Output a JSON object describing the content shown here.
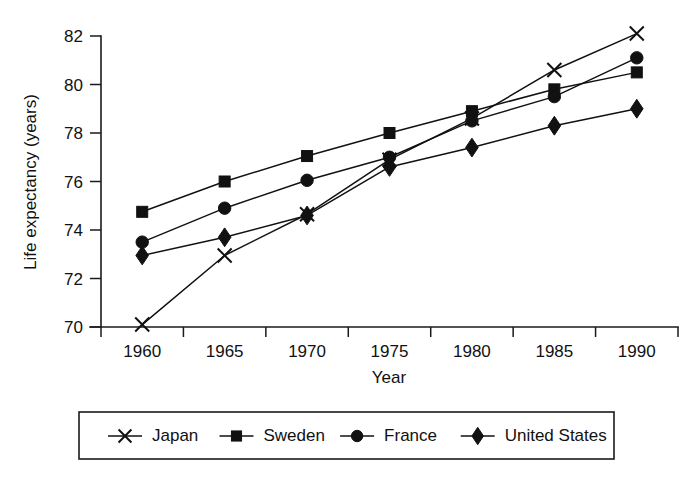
{
  "chart_data": {
    "type": "line",
    "title": "",
    "xlabel": "Year",
    "ylabel": "Life expectancy (years)",
    "categories": [
      "1960",
      "1965",
      "1970",
      "1975",
      "1980",
      "1985",
      "1990"
    ],
    "x": [
      1960,
      1965,
      1970,
      1975,
      1980,
      1985,
      1990
    ],
    "ylim": [
      70,
      82
    ],
    "yticks": [
      "70",
      "72",
      "74",
      "76",
      "78",
      "80",
      "82"
    ],
    "ytick_values": [
      70,
      72,
      74,
      76,
      78,
      80,
      82
    ],
    "xticks": [
      "1960",
      "1965",
      "1970",
      "1975",
      "1980",
      "1985",
      "1990"
    ],
    "grid": false,
    "legend_position": "bottom",
    "series": [
      {
        "name": "Japan",
        "marker": "cross-x",
        "values": [
          70.1,
          72.95,
          74.65,
          76.9,
          78.6,
          80.6,
          82.1
        ]
      },
      {
        "name": "Sweden",
        "marker": "square",
        "values": [
          74.75,
          76.0,
          77.05,
          78.0,
          78.9,
          79.8,
          80.5
        ]
      },
      {
        "name": "France",
        "marker": "circle",
        "values": [
          73.5,
          74.9,
          76.05,
          77.0,
          78.5,
          79.5,
          81.1
        ]
      },
      {
        "name": "United States",
        "marker": "diamond",
        "values": [
          72.95,
          73.7,
          74.6,
          76.6,
          77.4,
          78.3,
          79.0
        ]
      }
    ]
  },
  "legend": {
    "items": [
      {
        "label": "Japan",
        "marker": "cross-x"
      },
      {
        "label": "Sweden",
        "marker": "square"
      },
      {
        "label": "France",
        "marker": "circle"
      },
      {
        "label": "United States",
        "marker": "diamond"
      }
    ]
  },
  "colors": {
    "ink": "#111111",
    "axis": "#1a1a1a",
    "background": "#ffffff"
  }
}
